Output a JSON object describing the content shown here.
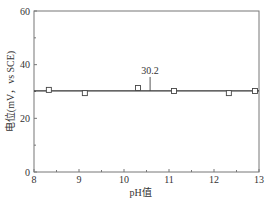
{
  "chart_data": {
    "type": "scatter",
    "title": "",
    "xlabel": "pH值",
    "ylabel": "电位(mV，vs SCE)",
    "xlim": [
      8,
      13
    ],
    "ylim": [
      0,
      60
    ],
    "xticks": [
      8,
      9,
      10,
      11,
      12,
      13
    ],
    "xtick_labels": [
      "8",
      "9",
      "10",
      "11",
      "12",
      "13"
    ],
    "yticks": [
      0,
      20,
      40,
      60
    ],
    "ytick_labels": [
      "0",
      "20",
      "40",
      "60"
    ],
    "grid": false,
    "legend": "none",
    "series": [
      {
        "name": "measured",
        "marker": "open-square",
        "x": [
          8.33,
          9.13,
          10.31,
          11.11,
          12.33,
          12.91
        ],
        "y": [
          30.6,
          29.4,
          31.3,
          30.2,
          29.4,
          30.2
        ]
      },
      {
        "name": "mean",
        "type": "hline",
        "y": 30.2
      }
    ],
    "annotations": [
      {
        "text": "30.2",
        "x": 10.58,
        "y": 30.2
      }
    ]
  }
}
